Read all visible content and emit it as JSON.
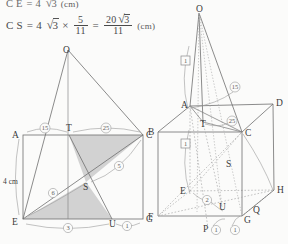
{
  "page": {
    "width": 288,
    "height": 244,
    "background": "#fbfbfa",
    "ink": "#3e3e3e"
  },
  "formulas": {
    "line1": {
      "lhs": "C E",
      "eq": "=",
      "coef": "4",
      "radicand": "3",
      "unit": "(cm)"
    },
    "line2": {
      "lhs": "C S",
      "eq": "=",
      "coef": "4",
      "radicand": "3",
      "times": "×",
      "frac1_num": "5",
      "frac1_den": "11",
      "eq2": "=",
      "frac2_num_coef": "20",
      "frac2_num_rad": "3",
      "frac2_den": "11",
      "unit": "(cm)"
    }
  },
  "figures": {
    "left": {
      "name": "rectangle-AEGC-with-apex-O",
      "vertices": [
        {
          "id": "O",
          "label": "O",
          "x": 68,
          "y": 14
        },
        {
          "id": "A",
          "label": "A",
          "x": 23,
          "y": 99
        },
        {
          "id": "C",
          "label": "C",
          "x": 143,
          "y": 99
        },
        {
          "id": "E",
          "label": "E",
          "x": 23,
          "y": 183
        },
        {
          "id": "G",
          "label": "G",
          "x": 143,
          "y": 183
        },
        {
          "id": "T",
          "label": "T",
          "x": 69,
          "y": 99
        },
        {
          "id": "U",
          "label": "U",
          "x": 112,
          "y": 183
        },
        {
          "id": "S",
          "label": "S",
          "x": 86,
          "y": 146
        }
      ],
      "ratio_labels": [
        {
          "id": "AT",
          "text": "15",
          "x": 45,
          "y": 94
        },
        {
          "id": "TC",
          "text": "25",
          "x": 106,
          "y": 94
        },
        {
          "id": "EU",
          "text": "3",
          "x": 68,
          "y": 190
        },
        {
          "id": "UG",
          "text": "1",
          "x": 127,
          "y": 189
        },
        {
          "id": "ES",
          "text": "6",
          "x": 53,
          "y": 156
        },
        {
          "id": "SC",
          "text": "5",
          "x": 119,
          "y": 131
        }
      ],
      "measure": {
        "text": "4 cm",
        "x": 5,
        "y": 145
      },
      "shaded_fill": "#d2d2d2",
      "shaded_triangles": [
        "T-S-C",
        "E-S-U"
      ]
    },
    "right": {
      "name": "cube-ABCD-EFGH-with-apex-O",
      "vertices": [
        {
          "id": "O",
          "label": "O",
          "x": 54,
          "y": 5
        },
        {
          "id": "A",
          "label": "A",
          "x": 45,
          "y": 102
        },
        {
          "id": "D",
          "label": "D",
          "x": 128,
          "y": 100
        },
        {
          "id": "B",
          "label": "B",
          "x": 13,
          "y": 128
        },
        {
          "id": "C",
          "label": "C",
          "x": 97,
          "y": 128
        },
        {
          "id": "E",
          "label": "E",
          "x": 45,
          "y": 187
        },
        {
          "id": "H",
          "label": "H",
          "x": 129,
          "y": 186
        },
        {
          "id": "F",
          "label": "F",
          "x": 13,
          "y": 212
        },
        {
          "id": "G",
          "label": "G",
          "x": 97,
          "y": 212
        },
        {
          "id": "T",
          "label": "T",
          "x": 58,
          "y": 118
        },
        {
          "id": "S",
          "label": "S",
          "x": 84,
          "y": 160
        },
        {
          "id": "U",
          "label": "U",
          "x": 77,
          "y": 203
        },
        {
          "id": "Q",
          "label": "Q",
          "x": 110,
          "y": 206
        },
        {
          "id": "P",
          "label": "P",
          "x": 63,
          "y": 224
        }
      ],
      "ratio_labels": [
        {
          "id": "r15",
          "text": "15",
          "x": 90,
          "y": 84
        },
        {
          "id": "r25",
          "text": "25",
          "x": 86,
          "y": 117
        },
        {
          "id": "r2",
          "text": "2",
          "x": 62,
          "y": 196
        },
        {
          "id": "p1",
          "text": "1",
          "x": 70,
          "y": 226
        },
        {
          "id": "p2",
          "text": "1",
          "x": 89,
          "y": 226
        }
      ],
      "boxed_labels": [
        {
          "id": "box1",
          "text": "1",
          "x": 40,
          "y": 57
        },
        {
          "id": "box2",
          "text": "1",
          "x": 40,
          "y": 140
        }
      ]
    }
  }
}
